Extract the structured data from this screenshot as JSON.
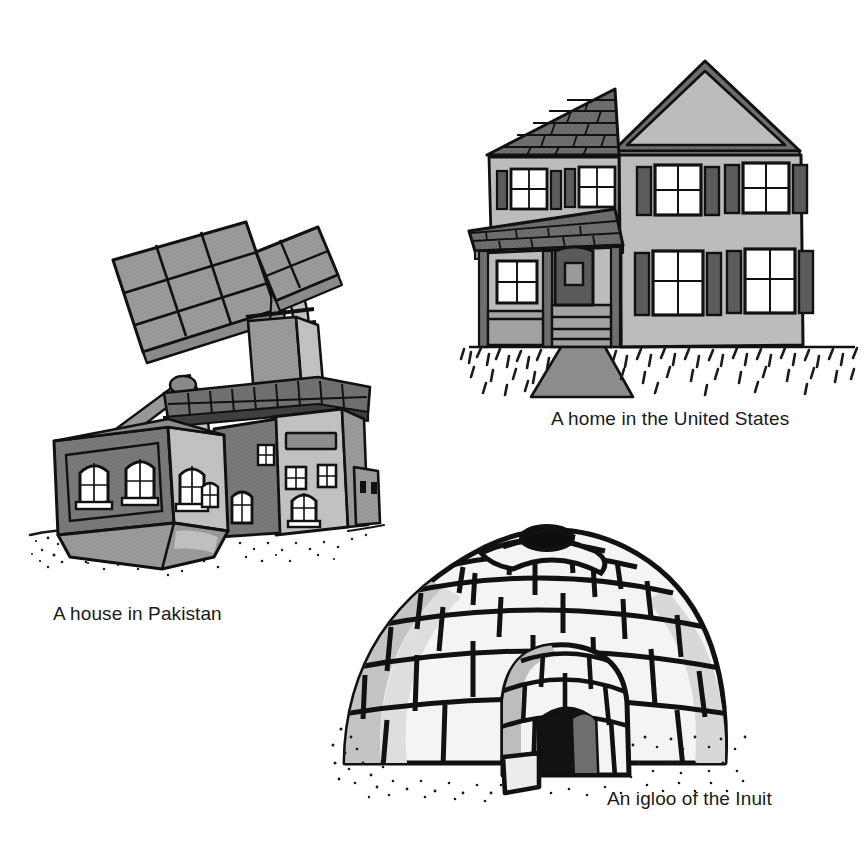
{
  "page": {
    "background_color": "#ffffff",
    "width": 868,
    "height": 845,
    "kind": "illustration-plate"
  },
  "figures": [
    {
      "id": "pakistan-house",
      "caption": "A house in Pakistan",
      "subject": "house-with-windcatchers",
      "icon": "house-pakistan-illustration"
    },
    {
      "id": "us-home",
      "caption": "A home in the United States",
      "subject": "two-story-suburban-house",
      "icon": "house-united-states-illustration"
    },
    {
      "id": "inuit-igloo",
      "caption": "An igloo of the Inuit",
      "subject": "snow-block-dome-dwelling",
      "icon": "igloo-illustration"
    }
  ],
  "captions": {
    "pakistan": "A house in Pakistan",
    "united_states": "A home in the United States",
    "igloo": "An igloo of the Inuit"
  },
  "palette": {
    "ink": "#111111",
    "white": "#ffffff",
    "paper": "#ffffff",
    "light_gray": "#d8d8d8",
    "wall_light": "#bdbdbd",
    "wall_mid": "#9a9a9a",
    "wall_dark": "#7a7a7a",
    "roof_gray": "#6a6a6a",
    "roof_dark": "#4f4f4f",
    "shadow_dark": "#3a3a3a",
    "snow_white": "#f4f4f4",
    "snow_shade": "#c9c9c9",
    "snow_shade2": "#a9a9a9",
    "text": "#1a1a1a"
  }
}
